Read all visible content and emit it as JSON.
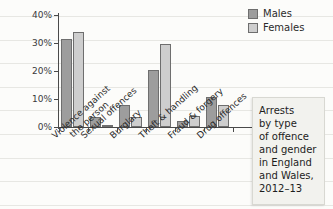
{
  "chart_data": {
    "type": "bar",
    "title": "",
    "xlabel": "",
    "ylabel": "Proportion",
    "ylim": [
      0,
      40
    ],
    "ytick_labels": [
      "0%",
      "10%",
      "20%",
      "30%",
      "40%"
    ],
    "ytick_values": [
      0,
      10,
      20,
      30,
      40
    ],
    "grid": false,
    "legend_position": "top-right",
    "categories": [
      "Violence against the person",
      "Sexual offences",
      "Burglary",
      "Theft & handling",
      "Fraud & forgery",
      "Drug offences"
    ],
    "category_lines": [
      [
        "Violence against",
        "the person"
      ],
      [
        "Sexual offences"
      ],
      [
        "Burglary"
      ],
      [
        "Theft & handling"
      ],
      [
        "Fraud & forgery"
      ],
      [
        "Drug offences"
      ]
    ],
    "series": [
      {
        "name": "Males",
        "color": "#9d9d9d",
        "values": [
          31.5,
          3.5,
          7.8,
          20.5,
          2.2,
          10.6
        ]
      },
      {
        "name": "Females",
        "color": "#cecece",
        "values": [
          34.0,
          0.4,
          3.4,
          29.5,
          3.9,
          7.7
        ]
      }
    ]
  },
  "legend": {
    "items": [
      {
        "label": "Males"
      },
      {
        "label": "Females"
      }
    ]
  },
  "caption": {
    "lines": [
      "Arrests",
      "by type",
      "of offence",
      "and gender",
      "in England",
      "and Wales,",
      "2012–13"
    ],
    "text": "Arrests by type of offence and gender in England and Wales, 2012–13"
  }
}
